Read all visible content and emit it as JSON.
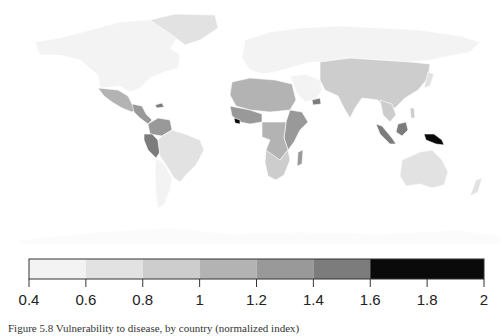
{
  "legend": {
    "breaks": [
      0.4,
      0.6,
      0.8,
      1.0,
      1.2,
      1.4,
      1.6,
      2.0
    ],
    "tick_labels": [
      "0.4",
      "0.6",
      "0.8",
      "1",
      "1.2",
      "1.4",
      "1.6",
      "1.8",
      "2"
    ],
    "bin_colors": [
      "#f3f3f3",
      "#e2e2e2",
      "#cdcdcd",
      "#b3b3b3",
      "#999999",
      "#7c7c7c",
      "#0a0a0a"
    ]
  },
  "regions": [
    {
      "name": "North America (USA, Canada)",
      "bin": 0
    },
    {
      "name": "Greenland",
      "bin": 0
    },
    {
      "name": "Europe & Russia",
      "bin": 0
    },
    {
      "name": "Mexico",
      "bin": 4
    },
    {
      "name": "Central America",
      "bin": 4
    },
    {
      "name": "Caribbean (Haiti)",
      "bin": 5
    },
    {
      "name": "Colombia / Venezuela",
      "bin": 4
    },
    {
      "name": "Peru / Ecuador",
      "bin": 5
    },
    {
      "name": "Brazil / South America",
      "bin": 1
    },
    {
      "name": "Chile / Argentina",
      "bin": 0
    },
    {
      "name": "North Africa / Sahara",
      "bin": 3
    },
    {
      "name": "West Africa",
      "bin": 4
    },
    {
      "name": "Sierra Leone / Liberia",
      "bin": 6
    },
    {
      "name": "Nigeria",
      "bin": 6
    },
    {
      "name": "Ethiopia / East Africa",
      "bin": 4
    },
    {
      "name": "Central Africa",
      "bin": 3
    },
    {
      "name": "Southern Africa",
      "bin": 2
    },
    {
      "name": "Madagascar",
      "bin": 4
    },
    {
      "name": "Middle East",
      "bin": 0
    },
    {
      "name": "Yemen",
      "bin": 5
    },
    {
      "name": "South & Central Asia / China",
      "bin": 2
    },
    {
      "name": "Southeast Asia mainland",
      "bin": 2
    },
    {
      "name": "Sumatra / Indonesia",
      "bin": 5
    },
    {
      "name": "Borneo",
      "bin": 5
    },
    {
      "name": "Papua New Guinea",
      "bin": 6
    },
    {
      "name": "Philippines",
      "bin": 2
    },
    {
      "name": "Australia",
      "bin": 1
    },
    {
      "name": "New Zealand",
      "bin": 1
    },
    {
      "name": "Japan",
      "bin": 1
    },
    {
      "name": "Antarctica",
      "bin": 0
    }
  ],
  "caption": "Figure 5.8  Vulnerability to disease, by country (normalized index)"
}
